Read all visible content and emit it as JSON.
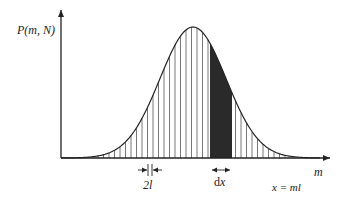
{
  "figure": {
    "y_axis_label": "P(m, N)",
    "x_axis_label": "m",
    "relation_label": "x = ml",
    "spacing_label": "2l",
    "interval_label": "dx"
  },
  "geometry": {
    "origin": [
      61,
      158
    ],
    "x_axis_end": 330,
    "y_axis_top": 10,
    "peak_x": 193,
    "peak_y": 27,
    "sigma_px": 33,
    "hatch_spacing": 5.5,
    "hatch_start_x": 98,
    "hatch_end_x": 290,
    "shaded_from_x": 210,
    "shaded_to_x": 232
  },
  "colors": {
    "line": "#222222",
    "hatch": "#555555",
    "shade": "#2a2a2a"
  }
}
